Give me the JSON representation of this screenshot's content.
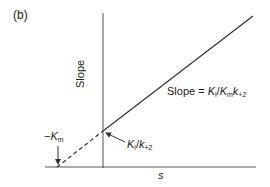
{
  "panel_label": "(b)",
  "axes": {
    "y_label": "Slope",
    "x_label": "s"
  },
  "annotations": {
    "slope_prefix": "Slope = ",
    "slope_K1": "K",
    "slope_K1_sub": "i",
    "slope_slash": "/",
    "slope_K2": "K",
    "slope_K2_sub": "m",
    "slope_k": "k",
    "slope_k_sub": "+2",
    "intercept_K": "K",
    "intercept_K_sub": "i",
    "intercept_slash": "/",
    "intercept_k": "k",
    "intercept_k_sub": "+2",
    "neg_km_minus": "−",
    "neg_km_K": "K",
    "neg_km_sub": "m"
  },
  "colors": {
    "line": "#333333"
  }
}
